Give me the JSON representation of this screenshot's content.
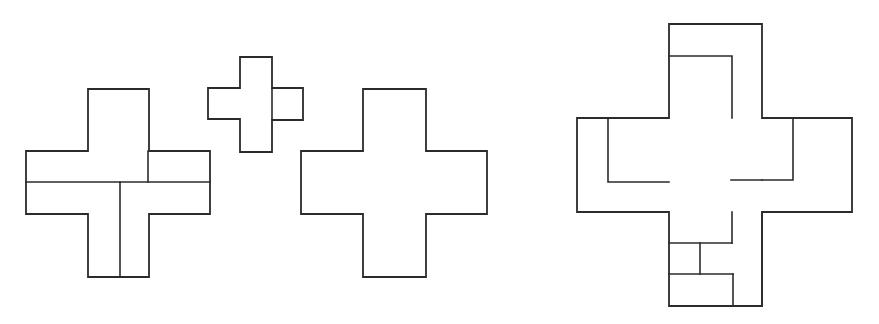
{
  "document": {
    "title": "Polyomino cross tiling diagram",
    "background_color": "#ffffff",
    "stroke_color": "#2b2b2b",
    "width": 879,
    "height": 324
  },
  "figures": [
    {
      "id": "figure-left",
      "name": "overlapping-cross-pair-left",
      "description": "Two overlapping plus-shaped (cross pentomino) outlines with visible internal dividing lines",
      "parts": [
        {
          "name": "large-cross-outline",
          "type": "outline",
          "path": "M 88 89 L 149 89 L 149 151 L 210 151 L 210 214 L 149 214 L 149 277 L 88 277 L 88 214 L 26 214 L 26 151 L 88 151 Z"
        },
        {
          "name": "horizontal-divider",
          "type": "divider",
          "path": "M 26 182 L 210 182"
        },
        {
          "name": "vertical-divider",
          "type": "divider",
          "path": "M 120 182 L 120 277"
        },
        {
          "name": "inner-corner-divider",
          "type": "divider",
          "path": "M 148 151 L 148 182"
        }
      ]
    },
    {
      "id": "figure-small-cross",
      "name": "small-cross",
      "description": "Small plus-shaped outline with an offset right arm",
      "parts": [
        {
          "name": "small-cross-outline",
          "type": "outline",
          "path": "M 240 57 L 272 57 L 272 88 L 303 88 L 303 120 L 272 120 L 272 152 L 240 152 L 240 119 L 208 119 L 208 88 L 240 88 Z"
        },
        {
          "name": "right-arm-divider",
          "type": "divider",
          "path": "M 272 88 L 272 120"
        }
      ]
    },
    {
      "id": "figure-plain-cross",
      "name": "plain-cross",
      "description": "A single clean plus-shaped (cross pentomino) outline",
      "parts": [
        {
          "name": "plain-cross-outline",
          "type": "outline",
          "path": "M 363 89 L 426 89 L 426 151 L 487 151 L 487 214 L 426 214 L 426 277 L 363 277 L 363 214 L 301 214 L 301 151 L 363 151 Z"
        }
      ]
    },
    {
      "id": "figure-right",
      "name": "interlocking-cross-assembly",
      "description": "A central cross surrounded by four interlocking cross arms forming a pinwheel assembly",
      "parts": [
        {
          "name": "central-cross-outline",
          "type": "outline",
          "path": "M 669 24 L 762 24 L 762 118 L 852 118 L 852 212 L 762 212 L 762 306 L 669 306 L 669 212 L 577 212 L 577 118 L 669 118 Z"
        },
        {
          "name": "top-arm-notch",
          "type": "divider",
          "path": "M 669 56 L 732 56 L 732 118"
        },
        {
          "name": "left-arm-notch",
          "type": "divider",
          "path": "M 608 118 L 608 182 L 669 182"
        },
        {
          "name": "right-arm-notch",
          "type": "divider",
          "path": "M 793 118 L 793 180 L 762 180"
        },
        {
          "name": "right-arm-lower-edge",
          "type": "divider",
          "path": "M 762 180 L 731 180"
        },
        {
          "name": "bottom-upper-box-divider",
          "type": "divider",
          "path": "M 669 243 L 732 243"
        },
        {
          "name": "bottom-inner-vertical",
          "type": "divider",
          "path": "M 700 243 L 700 274"
        },
        {
          "name": "bottom-lower-box-top",
          "type": "divider",
          "path": "M 669 274 L 733 274"
        },
        {
          "name": "bottom-lower-box-right",
          "type": "divider",
          "path": "M 733 274 L 733 306"
        },
        {
          "name": "bottom-arm-stem",
          "type": "divider",
          "path": "M 732 212 L 732 243"
        },
        {
          "name": "bottom-right-stem",
          "type": "divider",
          "path": "M 762 212 L 762 306"
        }
      ]
    }
  ]
}
